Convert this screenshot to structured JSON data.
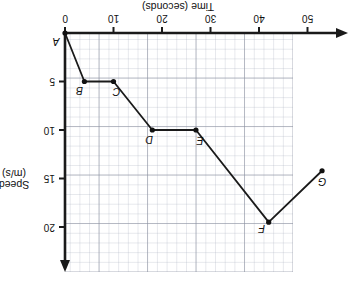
{
  "chart_data": {
    "type": "line",
    "title": "",
    "xlabel": "Time (seconds)",
    "ylabel": "Speed (m/s)",
    "xlim": [
      0,
      47
    ],
    "ylim": [
      0,
      24.6
    ],
    "x_ticks": [
      0,
      10,
      20,
      30,
      40,
      50
    ],
    "x_tick_labels": [
      "0",
      "10",
      "20",
      "30",
      "40",
      "50"
    ],
    "y_ticks": [
      5,
      10,
      15,
      20
    ],
    "y_tick_labels": [
      "5",
      "10",
      "15",
      "20"
    ],
    "grid": true,
    "grid_minor_step_x": 2,
    "grid_minor_step_y": 1,
    "grid_major_step_x": 10,
    "grid_major_step_y": 5,
    "legend": "none",
    "orientation": "rotated-180",
    "series": [
      {
        "name": "Speed vs Time",
        "marker": "filled-circle",
        "points": [
          {
            "label": "A",
            "x": 0,
            "y": 0
          },
          {
            "label": "B",
            "x": 4,
            "y": 5
          },
          {
            "label": "C",
            "x": 10,
            "y": 5
          },
          {
            "label": "D",
            "x": 18,
            "y": 10
          },
          {
            "label": "E",
            "x": 27,
            "y": 10
          },
          {
            "label": "F",
            "x": 42,
            "y": 19.5
          },
          {
            "label": "G",
            "x": 53,
            "y": 14.2
          }
        ]
      }
    ],
    "point_label_offsets": [
      {
        "label": "A",
        "dx": 9,
        "dy": -9
      },
      {
        "label": "B",
        "dx": 5,
        "dy": -10
      },
      {
        "label": "C",
        "dx": -3,
        "dy": -11
      },
      {
        "label": "D",
        "dx": 3,
        "dy": -10
      },
      {
        "label": "E",
        "dx": -4,
        "dy": -11
      },
      {
        "label": "F",
        "dx": 7,
        "dy": -7
      },
      {
        "label": "G",
        "dx": 0,
        "dy": -11
      }
    ],
    "colors": {
      "line": "#1a1a1a",
      "marker": "#111111",
      "axis": "#1a1a1a",
      "grid_major": "#8c91a0",
      "grid_minor": "#afb4c3",
      "background": "#ffffff",
      "text": "#111111"
    },
    "axis_arrows": [
      "x-negative-end",
      "y-positive-end"
    ]
  }
}
